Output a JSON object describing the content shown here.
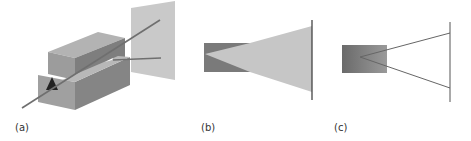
{
  "figure": {
    "panels": [
      {
        "id": "a",
        "label": "(a)",
        "description": "3D view of crystal block assembly with beam passing through and deflecting onto screen"
      },
      {
        "id": "b",
        "label": "(b)",
        "description": "Side view: block with diverging fan of light to screen"
      },
      {
        "id": "c",
        "label": "(c)",
        "description": "Side view: block with two diverging rays to screen"
      }
    ]
  },
  "colors": {
    "block_dark": "#6e6e6e",
    "block_mid": "#8c8c8c",
    "block_light": "#a8a8a8",
    "screen": "#c8c8c8",
    "fan": "#c4c4c4",
    "beam": "#707070",
    "line": "#555555"
  }
}
